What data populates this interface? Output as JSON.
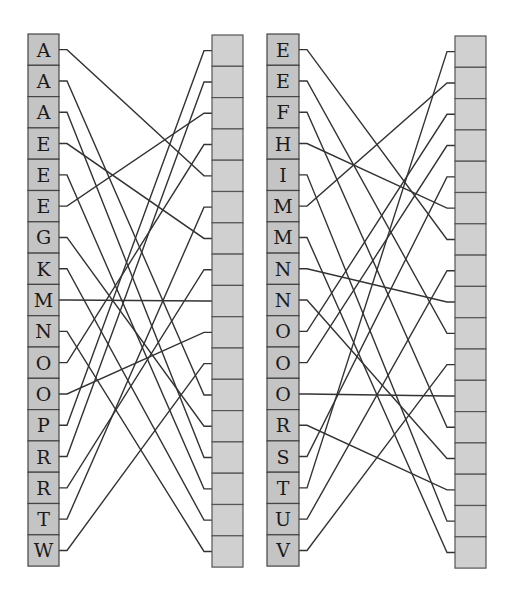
{
  "colors": {
    "left_cell_fill": "#c4c4c4",
    "right_cell_fill": "#d0d0d0",
    "cell_border": "#444444",
    "edge_stroke": "#333333",
    "background": "#ffffff"
  },
  "panels": [
    {
      "name": "panel-left",
      "left_column": {
        "x": 28,
        "y": 34,
        "w": 31,
        "cell_h": 31.3
      },
      "right_column": {
        "x": 212,
        "y": 35,
        "w": 31,
        "cell_h": 31.3
      },
      "labels": [
        "A",
        "A",
        "A",
        "E",
        "E",
        "E",
        "G",
        "K",
        "M",
        "N",
        "O",
        "O",
        "P",
        "R",
        "R",
        "T",
        "W"
      ],
      "edges": [
        [
          0,
          4
        ],
        [
          1,
          11
        ],
        [
          2,
          13
        ],
        [
          3,
          6
        ],
        [
          4,
          14
        ],
        [
          5,
          2
        ],
        [
          6,
          12
        ],
        [
          7,
          15
        ],
        [
          8,
          8
        ],
        [
          9,
          16
        ],
        [
          10,
          3
        ],
        [
          11,
          9
        ],
        [
          12,
          0
        ],
        [
          13,
          1
        ],
        [
          14,
          7
        ],
        [
          15,
          5
        ],
        [
          16,
          10
        ]
      ]
    },
    {
      "name": "panel-right",
      "left_column": {
        "x": 267,
        "y": 34,
        "w": 32,
        "cell_h": 31.3
      },
      "right_column": {
        "x": 455,
        "y": 36,
        "w": 31,
        "cell_h": 31.3
      },
      "labels": [
        "E",
        "E",
        "F",
        "H",
        "I",
        "M",
        "M",
        "N",
        "N",
        "O",
        "O",
        "O",
        "R",
        "S",
        "T",
        "U",
        "V"
      ],
      "edges": [
        [
          0,
          6
        ],
        [
          1,
          9
        ],
        [
          2,
          12
        ],
        [
          3,
          5
        ],
        [
          4,
          15
        ],
        [
          5,
          1
        ],
        [
          6,
          16
        ],
        [
          7,
          8
        ],
        [
          8,
          13
        ],
        [
          9,
          2
        ],
        [
          10,
          3
        ],
        [
          11,
          11
        ],
        [
          12,
          14
        ],
        [
          13,
          4
        ],
        [
          14,
          0
        ],
        [
          15,
          7
        ],
        [
          16,
          10
        ]
      ]
    }
  ]
}
